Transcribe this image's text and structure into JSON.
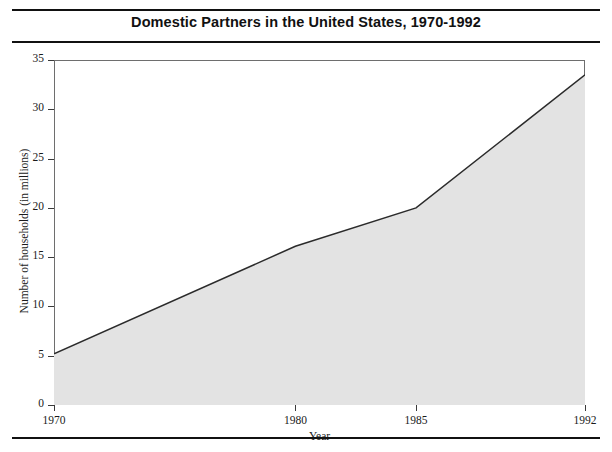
{
  "figure": {
    "title": "Domestic Partners in the United States, 1970-1992",
    "xaxis_title": "Year",
    "yaxis_title": "Number of households (in millions)"
  },
  "chart_data": {
    "type": "area",
    "title": "Domestic Partners in the United States, 1970-1992",
    "xlabel": "Year",
    "ylabel": "Number of households (in millions)",
    "x": [
      1970,
      1980,
      1985,
      1992
    ],
    "values": [
      5.2,
      16.1,
      20.0,
      33.5
    ],
    "series": [
      {
        "name": "Number of households (in millions)",
        "values": [
          5.2,
          16.1,
          20.0,
          33.5
        ]
      }
    ],
    "xlim": [
      1970,
      1992
    ],
    "ylim": [
      0,
      35
    ],
    "xticks": [
      1970,
      1980,
      1985,
      1992
    ],
    "xtick_labels": [
      "1970",
      "1980",
      "1985",
      "1992"
    ],
    "yticks": [
      0,
      5,
      10,
      15,
      20,
      25,
      30,
      35
    ],
    "ytick_labels": [
      "0",
      "5",
      "10",
      "15",
      "20",
      "25",
      "30",
      "35"
    ],
    "grid": false,
    "legend": "none",
    "fill_color": "#e3e3e3",
    "line_color": "#2b2b2b",
    "frame_color": "#6e6e6e"
  }
}
